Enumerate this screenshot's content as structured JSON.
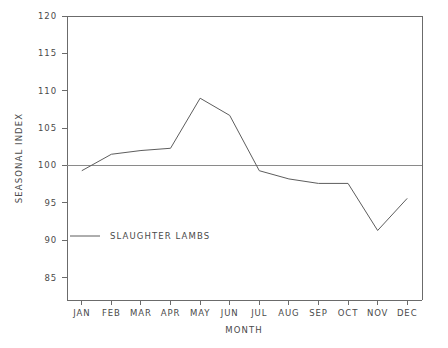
{
  "chart_data": {
    "type": "line",
    "title": "",
    "xlabel": "MONTH",
    "ylabel": "SEASONAL INDEX",
    "categories": [
      "JAN",
      "FEB",
      "MAR",
      "APR",
      "MAY",
      "JUN",
      "JUL",
      "AUG",
      "SEP",
      "OCT",
      "NOV",
      "DEC"
    ],
    "series": [
      {
        "name": "SLAUGHTER LAMBS",
        "values": [
          99.3,
          101.5,
          102.0,
          102.3,
          109.0,
          106.7,
          99.3,
          98.2,
          97.6,
          97.6,
          91.3,
          95.6
        ]
      }
    ],
    "ylim": [
      82,
      120
    ],
    "yticks": [
      85,
      90,
      95,
      100,
      105,
      110,
      115,
      120
    ],
    "ytick_labels": [
      "85",
      "90",
      "95",
      "100",
      "105",
      "110",
      "115",
      "120"
    ],
    "xtick_labels": [
      "JAN",
      "FEB",
      "MAR",
      "APR",
      "MAY",
      "JUN",
      "JUL",
      "AUG",
      "SEP",
      "OCT",
      "NOV",
      "DEC"
    ],
    "reference_line": {
      "value": 100,
      "label": ""
    },
    "grid": false,
    "legend_position": "inside-lower-left",
    "legend": [
      {
        "label": "SLAUGHTER LAMBS",
        "color": "#5d5d5d"
      }
    ],
    "line_color": "#5d5d5d",
    "axis_color": "#6b6b6b",
    "background": "#ffffff"
  }
}
